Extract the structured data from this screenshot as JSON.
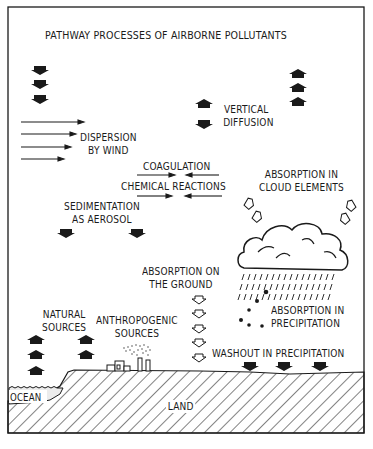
{
  "title": "PATHWAY PROCESSES OF AIRBORNE POLLUTANTS",
  "colors": {
    "ink": "#1a1a1a",
    "background": "#ffffff",
    "ocean_fill": "#e8e8e8"
  },
  "labels": {
    "vertical_diffusion": [
      "VERTICAL",
      "DIFFUSION"
    ],
    "dispersion": [
      "DISPERSION",
      "BY WIND"
    ],
    "coagulation": "COAGULATION",
    "chemical_reactions": "CHEMICAL REACTIONS",
    "sedimentation": [
      "SEDIMENTATION",
      "AS AEROSOL"
    ],
    "absorption_cloud": [
      "ABSORPTION IN",
      "CLOUD ELEMENTS"
    ],
    "absorption_ground": [
      "ABSORPTION ON",
      "THE GROUND"
    ],
    "natural_sources": [
      "NATURAL",
      "SOURCES"
    ],
    "anthropogenic_sources": [
      "ANTHROPOGENIC",
      "SOURCES"
    ],
    "absorption_precipitation": [
      "ABSORPTION IN",
      "PRECIPITATION"
    ],
    "washout": "WASHOUT IN PRECIPITATION",
    "ocean": "OCEAN",
    "land": "LAND"
  },
  "icons": {
    "down_arrow": "solid-down-arrow-icon",
    "up_arrow": "solid-up-arrow-icon",
    "open_down_arrow": "outline-down-arrow-icon",
    "open_arrow_cloud": "outline-arrow-icon",
    "wind_arrow": "right-arrow-icon",
    "cloud": "rain-cloud-icon",
    "factory": "factory-icon"
  }
}
